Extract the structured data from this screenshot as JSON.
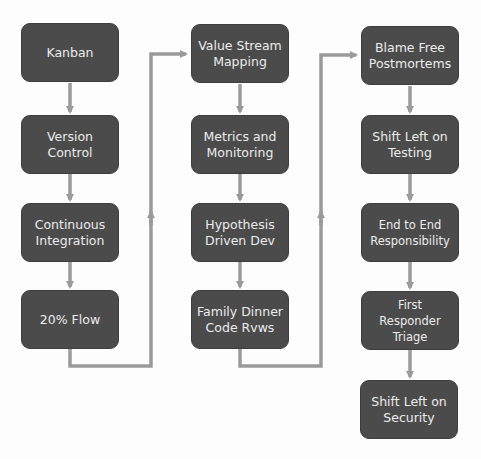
{
  "diagram": {
    "type": "flowchart",
    "columns": [
      {
        "name": "column-1",
        "nodes": [
          {
            "label": "Kanban"
          },
          {
            "label": "Version\nControl"
          },
          {
            "label": "Continuous\nIntegration"
          },
          {
            "label": "20% Flow"
          }
        ]
      },
      {
        "name": "column-2",
        "nodes": [
          {
            "label": "Value Stream\nMapping"
          },
          {
            "label": "Metrics and\nMonitoring"
          },
          {
            "label": "Hypothesis\nDriven Dev"
          },
          {
            "label": "Family Dinner\nCode Rvws"
          }
        ]
      },
      {
        "name": "column-3",
        "nodes": [
          {
            "label": "Blame Free\nPostmortems"
          },
          {
            "label": "Shift Left on\nTesting"
          },
          {
            "label": "End to End\nResponsibility"
          },
          {
            "label": "First Responder\nTriage"
          },
          {
            "label": "Shift Left on\nSecurity"
          }
        ]
      }
    ],
    "colors": {
      "node_fill": "#4b4b4b",
      "node_text": "#ececec",
      "connector": "#9a9a9a",
      "background": "#fdfdfd"
    }
  }
}
